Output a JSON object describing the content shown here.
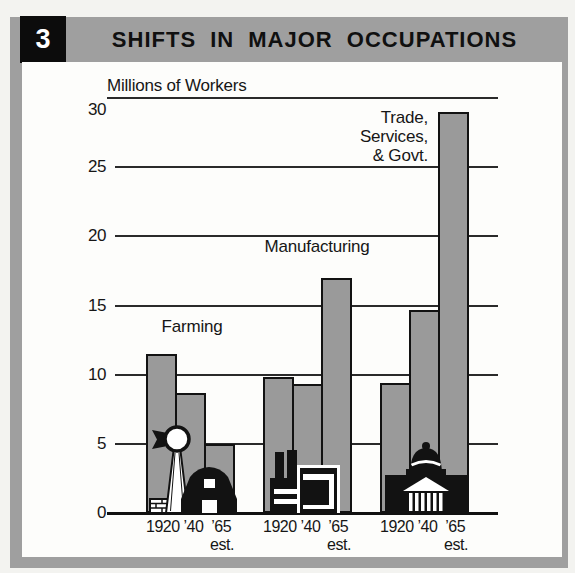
{
  "page": {
    "figure_number": "3",
    "title": "SHIFTS IN MAJOR OCCUPATIONS"
  },
  "chart_data": {
    "type": "bar",
    "title": "SHIFTS IN MAJOR OCCUPATIONS",
    "ylabel": "Millions of Workers",
    "xlabel": "",
    "ylim": [
      0,
      30
    ],
    "yticks": [
      30,
      25,
      20,
      15,
      10,
      5,
      0
    ],
    "grid": true,
    "categories": [
      "1920",
      "’40",
      "’65"
    ],
    "est_label": "est.",
    "series": [
      {
        "name": "Farming",
        "values": [
          11.5,
          8.7,
          5.0
        ]
      },
      {
        "name": "Manufacturing",
        "values": [
          9.8,
          9.3,
          17.0
        ]
      },
      {
        "name": "Trade, Services, & Govt.",
        "values": [
          9.4,
          14.7,
          29.0
        ]
      }
    ],
    "annotations": [
      {
        "text": "Farming"
      },
      {
        "text": "Manufacturing"
      },
      {
        "lines": [
          "Trade, Services,",
          "& Govt."
        ]
      }
    ],
    "icons": [
      "windmill-barn-icon",
      "factory-icon",
      "capitol-icon"
    ]
  },
  "colors": {
    "frame_gray": "#9f9f9f",
    "bar_gray": "#9a9a9a",
    "ink": "#121212",
    "paper": "#fdfdfb"
  }
}
